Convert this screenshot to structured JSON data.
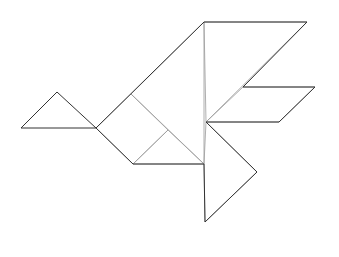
{
  "figure": {
    "pieces": [
      {
        "name": "head-triangle",
        "kind": "small triangle"
      },
      {
        "name": "neck-square",
        "kind": "square"
      },
      {
        "name": "body-triangle-large",
        "kind": "large triangle"
      },
      {
        "name": "body-triangle-small",
        "kind": "small triangle"
      },
      {
        "name": "wing-triangle-large",
        "kind": "large triangle"
      },
      {
        "name": "wing-parallelogram",
        "kind": "parallelogram"
      },
      {
        "name": "tail-triangle",
        "kind": "medium triangle"
      }
    ],
    "colors": {
      "background": "#ffffff",
      "outline": "#333333",
      "inner_edge": "#9a9a9a"
    }
  }
}
